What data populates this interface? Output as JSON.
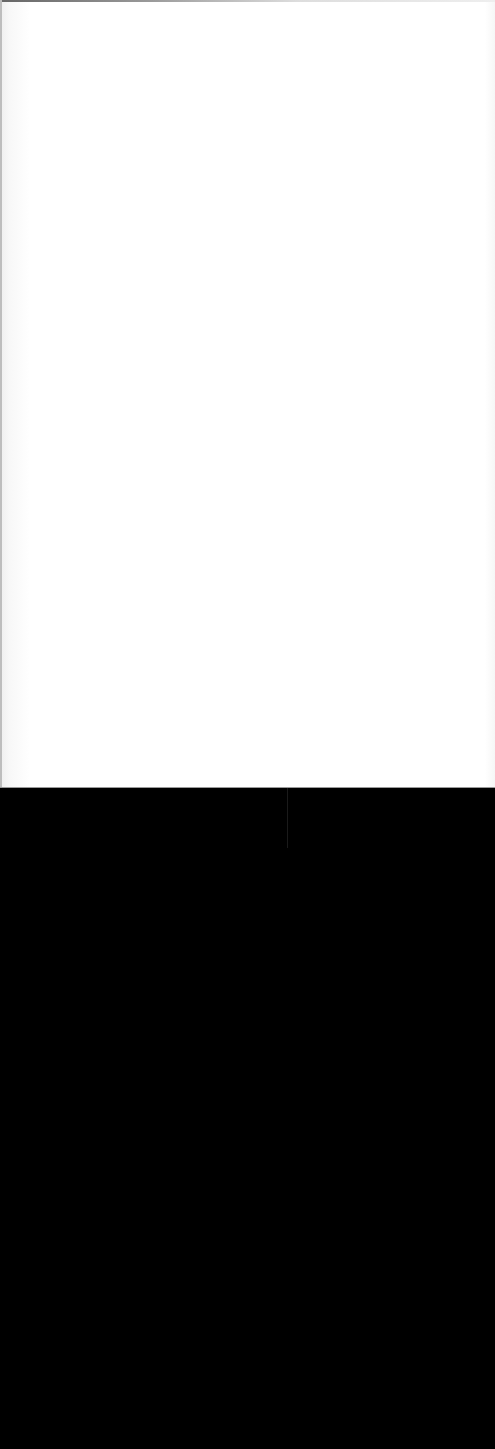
{
  "screen": {
    "description": "",
    "colors": {
      "upper_background": "#ffffff",
      "lower_background": "#000000",
      "divider": "#9a9a9a"
    }
  }
}
